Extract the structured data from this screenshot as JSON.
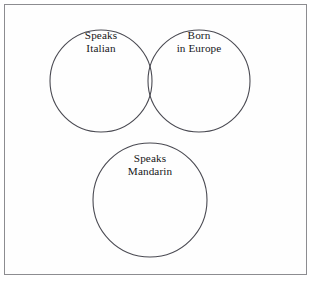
{
  "figure": {
    "type": "venn-diagram",
    "background_color": "#ffffff",
    "frame_color": "#8c8c90",
    "circle_stroke_color": "#4a4a52",
    "label_text_color": "#17171a"
  },
  "sets": [
    {
      "id": "speaks-italian",
      "name": "Speaks Italian",
      "label_lines": [
        "Speaks",
        "Italian"
      ],
      "line1": "Speaks",
      "line2": "Italian",
      "cx": 101,
      "cy": 81,
      "r": 51
    },
    {
      "id": "born-in-europe",
      "name": "Born in Europe",
      "label_lines": [
        "Born",
        "in Europe"
      ],
      "line1": "Born",
      "line2": "in Europe",
      "cx": 199,
      "cy": 81,
      "r": 51
    },
    {
      "id": "speaks-mandarin",
      "name": "Speaks Mandarin",
      "label_lines": [
        "Speaks",
        "Mandarin"
      ],
      "line1": "Speaks",
      "line2": "Mandarin",
      "cx": 150,
      "cy": 200,
      "r": 57
    }
  ],
  "regions": {
    "overlaps": [
      {
        "sets": [
          "speaks-italian",
          "born-in-europe"
        ],
        "overlapping": true
      },
      {
        "sets": [
          "speaks-italian",
          "speaks-mandarin"
        ],
        "overlapping": false
      },
      {
        "sets": [
          "born-in-europe",
          "speaks-mandarin"
        ],
        "overlapping": false
      }
    ]
  }
}
